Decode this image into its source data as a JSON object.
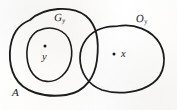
{
  "figure": {
    "kind": "set-diagram",
    "background_color": "#fdfdfc",
    "ink_color": "#1c1c1c"
  },
  "labels": {
    "outer_set": {
      "base": "A",
      "subscript": ""
    },
    "inner_set": {
      "base": "G",
      "subscript": "y"
    },
    "right_set": {
      "base": "O",
      "subscript": "y"
    }
  },
  "points": {
    "left_point": {
      "label": "y",
      "subscript": ""
    },
    "right_point": {
      "label": "x",
      "subscript": ""
    }
  },
  "geometry": {
    "outer_blob_path": "M 30 20 C 44 7, 72 5, 86 16 C 98 26, 99 44, 97 60 C 95 76, 86 92, 66 95 C 44 98, 23 92, 15 77 C 7 62, 9 42, 16 31 C 20 25, 25 22, 30 20 Z",
    "inner_blob_path": "M 40 30 C 52 25, 66 30, 70 42 C 74 54, 71 68, 62 76 C 53 84, 40 83, 33 74 C 26 65, 25 49, 30 39 C 33 34, 36 31, 40 30 Z",
    "right_blob_path": "M 118 26 C 134 23, 152 30, 160 44 C 167 57, 165 74, 153 83 C 140 93, 118 95, 102 90 C 88 85, 80 72, 80 58 C 80 44, 89 32, 103 28 C 108 26, 113 26, 118 26 Z",
    "left_dot": {
      "cx": 45,
      "cy": 46,
      "r": 1.5
    },
    "right_dot": {
      "cx": 114,
      "cy": 54,
      "r": 1.5
    }
  }
}
